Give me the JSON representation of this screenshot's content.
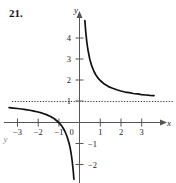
{
  "problem": {
    "number": "21."
  },
  "chart_data": {
    "type": "line",
    "title": "",
    "xlabel": "x",
    "ylabel": "y",
    "function": "y = 1 + 1/x",
    "xlim": [
      -3.6,
      3.9
    ],
    "ylim": [
      -2.9,
      5.0
    ],
    "grid": false,
    "legend": null,
    "x_ticks": [
      -3,
      -2,
      -1,
      0,
      1,
      2,
      3
    ],
    "x_tick_labels": [
      "−3",
      "−2",
      "−1",
      "0",
      "1",
      "2",
      "3"
    ],
    "y_ticks": [
      -2,
      -1,
      1,
      2,
      3,
      4
    ],
    "y_tick_labels": [
      "−2",
      "−1",
      "1",
      "2",
      "3",
      "4"
    ],
    "asymptotes": [
      {
        "kind": "horizontal",
        "value": 1,
        "style": "dotted",
        "label": "y = 1"
      },
      {
        "kind": "vertical",
        "value": 0,
        "style": "axis",
        "label": "x = 0"
      }
    ],
    "series": [
      {
        "name": "right-branch",
        "x": [
          0.26,
          0.3,
          0.35,
          0.4,
          0.5,
          0.6,
          0.7,
          0.8,
          0.9,
          1.0,
          1.2,
          1.4,
          1.6,
          1.8,
          2.0,
          2.2,
          2.4,
          2.6,
          2.8,
          3.0,
          3.2,
          3.4,
          3.6
        ],
        "y": [
          4.85,
          4.33,
          3.86,
          3.5,
          3.0,
          2.67,
          2.43,
          2.25,
          2.11,
          2.0,
          1.83,
          1.71,
          1.63,
          1.56,
          1.5,
          1.45,
          1.42,
          1.38,
          1.36,
          1.33,
          1.31,
          1.29,
          1.28
        ]
      },
      {
        "name": "left-branch",
        "x": [
          -3.4,
          -3.2,
          -3.0,
          -2.8,
          -2.6,
          -2.4,
          -2.2,
          -2.0,
          -1.8,
          -1.6,
          -1.4,
          -1.2,
          -1.0,
          -0.9,
          -0.8,
          -0.7,
          -0.6,
          -0.5,
          -0.45,
          -0.4,
          -0.35,
          -0.3,
          -0.27
        ],
        "y": [
          0.706,
          0.688,
          0.667,
          0.643,
          0.615,
          0.583,
          0.545,
          0.5,
          0.444,
          0.375,
          0.286,
          0.167,
          0.0,
          -0.111,
          -0.25,
          -0.429,
          -0.667,
          -1.0,
          -1.222,
          -1.5,
          -1.857,
          -2.333,
          -2.7
        ]
      }
    ]
  },
  "axes": {
    "x_axis_name": "x",
    "y_axis_name": "y",
    "stray_mark": "y"
  },
  "colors": {
    "curve": "#111111",
    "axis": "#555555",
    "asymptote": "#333333",
    "text": "#222222",
    "background": "#ffffff"
  }
}
